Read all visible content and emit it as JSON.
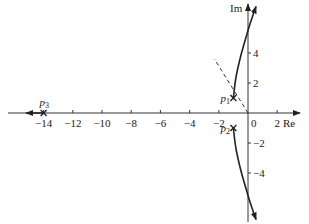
{
  "chart_data": {
    "type": "line",
    "xlabel": "Re",
    "ylabel": "Im",
    "xlim": [
      -15.5,
      2.8
    ],
    "ylim": [
      -6.2,
      7.5
    ],
    "x_ticks": [
      -14,
      -12,
      -10,
      -8,
      -6,
      -4,
      -2,
      0,
      2
    ],
    "x_tick_labels": [
      "-14",
      "-12",
      "-10",
      "-8",
      "-6",
      "-4",
      "-2",
      "0",
      "2"
    ],
    "y_ticks": [
      -4,
      -2,
      2,
      4
    ],
    "y_tick_labels": [
      "-4",
      "-2",
      "2",
      "4"
    ],
    "grid": false,
    "legend": null,
    "poles": [
      {
        "name": "p1",
        "label": "p",
        "sub": "1",
        "re": -1,
        "im": 1
      },
      {
        "name": "p2",
        "label": "p",
        "sub": "2",
        "re": -1,
        "im": -1
      },
      {
        "name": "p3",
        "label": "p",
        "sub": "3",
        "re": -14,
        "im": 0
      }
    ],
    "series": [
      {
        "name": "branch-upper",
        "points": [
          [
            -1,
            1
          ],
          [
            -0.9,
            2
          ],
          [
            -0.7,
            3
          ],
          [
            -0.45,
            4
          ],
          [
            -0.15,
            5
          ],
          [
            0.15,
            6
          ],
          [
            0.55,
            7.1
          ]
        ],
        "arrow": "end"
      },
      {
        "name": "branch-lower",
        "points": [
          [
            -1,
            -1
          ],
          [
            -0.9,
            -2
          ],
          [
            -0.7,
            -3
          ],
          [
            -0.45,
            -4
          ],
          [
            -0.15,
            -5
          ],
          [
            0.15,
            -6
          ],
          [
            0.55,
            -7.1
          ]
        ],
        "arrow": "end"
      },
      {
        "name": "branch-real",
        "points": [
          [
            -14,
            0
          ],
          [
            -15.2,
            0
          ]
        ],
        "arrow": "end"
      }
    ],
    "annotations": [
      {
        "type": "dashed-line",
        "from": [
          0,
          0
        ],
        "to": [
          -2.3,
          3.6
        ],
        "meaning": "damping ratio line"
      }
    ]
  },
  "labels": {
    "re": "Re",
    "im": "Im",
    "p": "p",
    "p1_sub": "1",
    "p2_sub": "2",
    "p3_sub": "3"
  }
}
